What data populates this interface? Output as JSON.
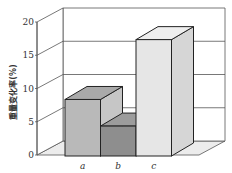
{
  "chart_data": {
    "type": "bar",
    "style": "3d",
    "title": "",
    "xlabel": "",
    "ylabel": "重量变化率(%)",
    "categories": [
      "a",
      "b",
      "c"
    ],
    "values": [
      8.5,
      4.5,
      17.5
    ],
    "ylim": [
      0,
      20
    ],
    "yticks": [
      0,
      5,
      10,
      15,
      20
    ],
    "grid": true,
    "legend": "none",
    "colors": {
      "bars": [
        {
          "front": "#b9b9b9",
          "top": "#a9a9a9",
          "side": "#c6c6c6"
        },
        {
          "front": "#8e8e8e",
          "top": "#9c9c9c",
          "side": "#a4a4a4"
        },
        {
          "front": "#e6e6e6",
          "top": "#eeeeee",
          "side": "#d6d6d6"
        }
      ],
      "floor": "#ececec",
      "lines": "#555555",
      "edges": "#222222"
    }
  }
}
